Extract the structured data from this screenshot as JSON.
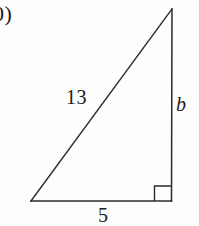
{
  "figure": {
    "kind": "right-triangle-diagram",
    "background_color": "#fdfdfb",
    "stroke_color": "#2a2a2a",
    "text_color": "#1b1b1b",
    "problem_number": "0)",
    "vertices": {
      "left": [
        31,
        201
      ],
      "apex": [
        172,
        9
      ],
      "right": [
        171,
        201
      ]
    },
    "right_angle_marker": {
      "at_vertex": "right",
      "size": 16
    },
    "labels": {
      "hypotenuse": "13",
      "vertical_leg": "b",
      "base_leg": "5"
    }
  }
}
